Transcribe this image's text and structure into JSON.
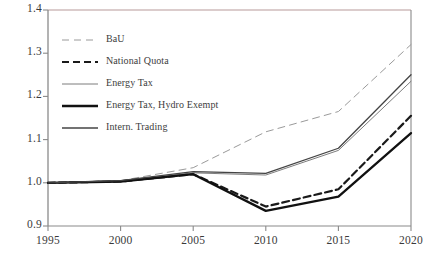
{
  "chart_data": {
    "type": "line",
    "title": "",
    "xlabel": "",
    "ylabel": "",
    "x": [
      1995,
      2000,
      2005,
      2010,
      2015,
      2020
    ],
    "xtick_labels": [
      "1995",
      "2000",
      "2005",
      "2010",
      "2015",
      "2020"
    ],
    "ytick_labels": [
      "0.9",
      "1.0",
      "1.1",
      "1.2",
      "1.3",
      "1.4"
    ],
    "ytick_values": [
      0.9,
      1.0,
      1.1,
      1.2,
      1.3,
      1.4
    ],
    "xlim": [
      1995,
      2020
    ],
    "ylim": [
      0.9,
      1.4
    ],
    "grid": false,
    "legend_position": "upper-left-inside",
    "series": [
      {
        "name": "BaU",
        "style": "dashed-thin-light",
        "color": "#9a9a9a",
        "values": [
          1.0,
          1.005,
          1.035,
          1.118,
          1.165,
          1.32
        ]
      },
      {
        "name": "National Quota",
        "style": "dashed-bold",
        "color": "#1a1a1a",
        "values": [
          1.0,
          1.003,
          1.02,
          0.945,
          0.985,
          1.155
        ]
      },
      {
        "name": "Energy Tax",
        "style": "solid-thin",
        "color": "#6e6e6e",
        "values": [
          1.0,
          1.005,
          1.023,
          1.018,
          1.075,
          1.235
        ]
      },
      {
        "name": "Energy Tax, Hydro Exempt",
        "style": "solid-thick",
        "color": "#111111",
        "values": [
          1.0,
          1.003,
          1.02,
          0.935,
          0.968,
          1.115
        ]
      },
      {
        "name": "Intern. Trading",
        "style": "solid-medium",
        "color": "#444444",
        "values": [
          1.0,
          1.005,
          1.026,
          1.022,
          1.08,
          1.25
        ]
      }
    ]
  },
  "legend": {
    "items": [
      {
        "label": "BaU"
      },
      {
        "label": "National Quota"
      },
      {
        "label": "Energy Tax"
      },
      {
        "label": "Energy Tax, Hydro Exempt"
      },
      {
        "label": "Intern. Trading"
      }
    ]
  },
  "colors": {
    "axis": "#8a8a8a",
    "frame_top_tint": "#c8a8a8",
    "text": "#3a3a3a",
    "background": "#ffffff"
  }
}
